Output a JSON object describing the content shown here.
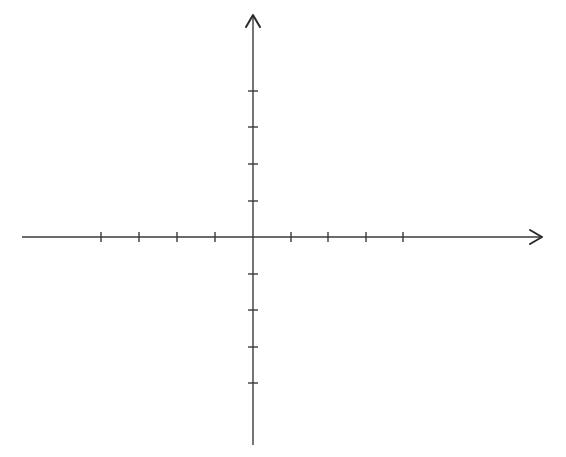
{
  "diagram": {
    "type": "cartesian-coordinate-plane",
    "colors": {
      "axis": "#3a3a3a",
      "background": "#ffffff"
    },
    "origin": {
      "x": 253,
      "y": 237
    },
    "x_axis": {
      "start": 22,
      "end": 542,
      "arrow": "right",
      "ticks_px": [
        101,
        139,
        177,
        215,
        291,
        328,
        366,
        403
      ],
      "tick_half_length": 5
    },
    "y_axis": {
      "start": 15,
      "end": 445,
      "arrow": "up",
      "ticks_px": [
        91,
        127,
        164,
        201,
        274,
        310,
        347,
        383
      ],
      "tick_half_length": 5
    },
    "labels": []
  }
}
